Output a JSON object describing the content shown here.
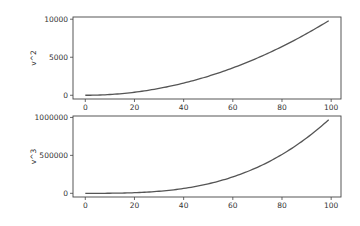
{
  "chart_data": [
    {
      "type": "line",
      "title": "",
      "xlabel": "",
      "ylabel": "v^2",
      "xlim": [
        -5,
        104
      ],
      "ylim": [
        -490,
        10290
      ],
      "xticks": [
        0,
        20,
        40,
        60,
        80,
        100
      ],
      "xtick_labels": [
        "0",
        "20",
        "40",
        "60",
        "80",
        "100"
      ],
      "yticks": [
        0,
        5000,
        10000
      ],
      "ytick_labels": [
        "0",
        "5000",
        "10000"
      ],
      "grid": false,
      "legend": null,
      "series": [
        {
          "name": "v^2",
          "color": "#555555",
          "x_range": [
            0,
            99
          ],
          "formula": "x^2",
          "x": [
            0,
            10,
            20,
            30,
            40,
            50,
            60,
            70,
            80,
            90,
            99
          ],
          "values": [
            0,
            100,
            400,
            900,
            1600,
            2500,
            3600,
            4900,
            6400,
            8100,
            9801
          ]
        }
      ]
    },
    {
      "type": "line",
      "title": "",
      "xlabel": "",
      "ylabel": "v^3",
      "xlim": [
        -5,
        104
      ],
      "ylim": [
        -48500,
        1018800
      ],
      "xticks": [
        0,
        20,
        40,
        60,
        80,
        100
      ],
      "xtick_labels": [
        "0",
        "20",
        "40",
        "60",
        "80",
        "100"
      ],
      "yticks": [
        0,
        500000,
        1000000
      ],
      "ytick_labels": [
        "0",
        "500000",
        "1000000"
      ],
      "grid": false,
      "legend": null,
      "series": [
        {
          "name": "v^3",
          "color": "#555555",
          "x_range": [
            0,
            99
          ],
          "formula": "x^3",
          "x": [
            0,
            10,
            20,
            30,
            40,
            50,
            60,
            70,
            80,
            90,
            99
          ],
          "values": [
            0,
            1000,
            8000,
            27000,
            64000,
            125000,
            216000,
            343000,
            512000,
            729000,
            970299
          ]
        }
      ]
    }
  ]
}
